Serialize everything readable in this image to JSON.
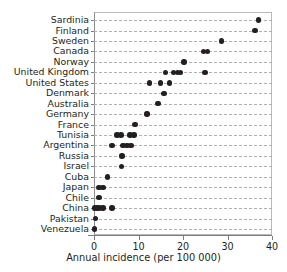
{
  "chart_data": {
    "type": "scatter",
    "title": "",
    "subtitle": "",
    "xlabel": "Annual incidence (per 100 000)",
    "ylabel": "",
    "xlim": [
      0,
      40
    ],
    "xticks": [
      0,
      10,
      20,
      30,
      40
    ],
    "xtick_labels": [
      "0",
      "10",
      "20",
      "30",
      "40"
    ],
    "grid": "horizontal-dashed",
    "legend": "none",
    "orientation": "horizontal",
    "categories": [
      "Sardinia",
      "Finland",
      "Sweden",
      "Canada",
      "Norway",
      "United Kingdom",
      "United States",
      "Denmark",
      "Australia",
      "Germany",
      "France",
      "Tunisia",
      "Argentina",
      "Russia",
      "Israel",
      "Cuba",
      "Japan",
      "Chile",
      "China",
      "Pakistan",
      "Venezuela"
    ],
    "points": [
      {
        "category": "Sardinia",
        "values": [
          37.0
        ]
      },
      {
        "category": "Finland",
        "values": [
          36.2
        ]
      },
      {
        "category": "Sweden",
        "values": [
          28.7
        ]
      },
      {
        "category": "Canada",
        "values": [
          24.6,
          25.5
        ]
      },
      {
        "category": "Norway",
        "values": [
          20.2
        ]
      },
      {
        "category": "United Kingdom",
        "values": [
          16.0,
          17.8,
          18.7,
          19.5,
          24.9
        ]
      },
      {
        "category": "United States",
        "values": [
          12.5,
          15.0,
          17.0
        ]
      },
      {
        "category": "Denmark",
        "values": [
          15.7
        ]
      },
      {
        "category": "Australia",
        "values": [
          14.4
        ]
      },
      {
        "category": "Germany",
        "values": [
          11.9
        ]
      },
      {
        "category": "France",
        "values": [
          9.2
        ]
      },
      {
        "category": "Tunisia",
        "values": [
          5.2,
          6.1,
          8.1,
          9.0
        ]
      },
      {
        "category": "Argentina",
        "values": [
          4.0,
          6.5,
          7.4,
          8.3
        ]
      },
      {
        "category": "Russia",
        "values": [
          6.3
        ]
      },
      {
        "category": "Israel",
        "values": [
          6.2
        ]
      },
      {
        "category": "Cuba",
        "values": [
          3.1
        ]
      },
      {
        "category": "Japan",
        "values": [
          1.1,
          2.0
        ]
      },
      {
        "category": "Chile",
        "values": [
          1.1
        ]
      },
      {
        "category": "China",
        "values": [
          0.1,
          0.7,
          1.3,
          2.0,
          4.0
        ]
      },
      {
        "category": "Pakistan",
        "values": [
          0.4
        ]
      },
      {
        "category": "Venezuela",
        "values": [
          0.1
        ]
      }
    ],
    "marker": {
      "shape": "circle",
      "color": "#231f20",
      "size_px": 5.4
    },
    "colors": {
      "marker": "#231f20",
      "axis": "#7d7d7d",
      "grid": "#b0b0b0",
      "frame": "#b9b9b9",
      "text": "#231f20",
      "background": "#ffffff"
    }
  }
}
